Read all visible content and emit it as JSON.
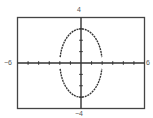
{
  "chart_data": {
    "type": "line",
    "title": "",
    "xlabel": "",
    "ylabel": "",
    "xlim": [
      -6,
      6
    ],
    "ylim": [
      -4,
      4
    ],
    "xtick_step": 1,
    "ytick_step": 1,
    "grid": false,
    "legend": null,
    "window_labels": {
      "xmin": "−6",
      "xmax": "6",
      "ymin": "−4",
      "ymax": "4"
    },
    "series": [
      {
        "name": "upper half",
        "equation": "y = 3*sqrt(1 - x^2/4)",
        "domain": [
          -2,
          2
        ],
        "style": "dotted"
      },
      {
        "name": "lower half",
        "equation": "y = -3*sqrt(1 - x^2/4)",
        "domain": [
          -2,
          2
        ],
        "style": "dotted"
      }
    ],
    "shape": "ellipse",
    "center": [
      0,
      0
    ],
    "semi_axis_x": 2,
    "semi_axis_y": 3
  },
  "colors": {
    "frame": "#444444",
    "axis": "#333333",
    "curve": "#333333",
    "label": "#555555"
  }
}
